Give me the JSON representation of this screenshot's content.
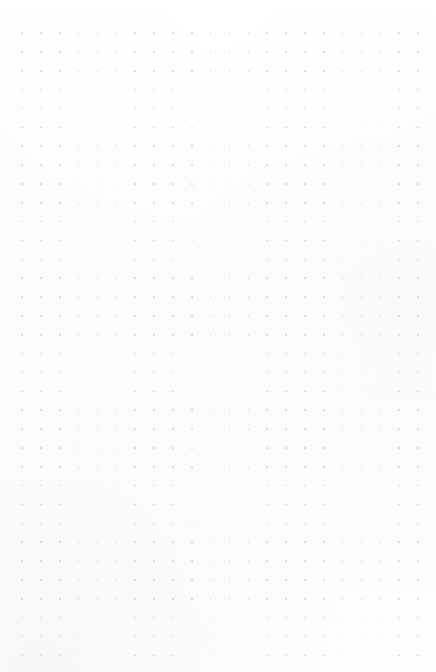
{
  "page": {
    "kind": "dot-grid-notebook-page",
    "width": 436,
    "height": 672,
    "background_color": "#fcfcfc",
    "paper_tint_color": "#fbfbfc",
    "has_text": false,
    "has_ui_chrome": false,
    "visible_text": ""
  },
  "dot_grid": {
    "dot_color": "#d7d7da",
    "dot_size_px": 1.6,
    "spacing_px": 18.86,
    "origin_x_px": 22,
    "origin_y_px": 33,
    "columns": 22,
    "rows": 34,
    "margin_left_px": 22,
    "margin_right_px": 18,
    "margin_top_px": 33,
    "margin_bottom_px": 21,
    "last_column_x_px": 418,
    "last_row_y_px": 651
  }
}
